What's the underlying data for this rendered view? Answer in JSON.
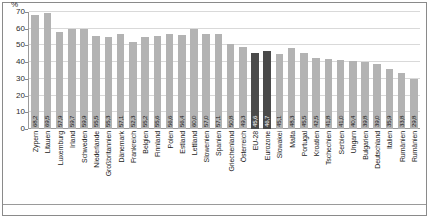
{
  "chart_data": {
    "type": "bar",
    "title": "",
    "xlabel": "",
    "ylabel": "%",
    "ylim": [
      0,
      70
    ],
    "yticks": [
      0,
      10,
      20,
      30,
      40,
      50,
      60,
      70
    ],
    "grid": true,
    "legend": "none",
    "highlight_color": "#4a4a4a",
    "bar_color": "#b3b3b3",
    "highlighted_categories": [
      "EU-28",
      "Eurozone"
    ],
    "categories": [
      "Zypern",
      "Litauen",
      "Luxemburg",
      "Irland",
      "Schweden",
      "Niederlande",
      "Großbritannien",
      "Dänemark",
      "Frankreich",
      "Belgien",
      "Finnland",
      "Polen",
      "Estland",
      "Lettland",
      "Slowenien",
      "Spanien",
      "Griechenland",
      "Österreich",
      "EU-28",
      "Eurozone",
      "Slowakei",
      "Malta",
      "Portugal",
      "Kroatien",
      "Tschechien",
      "Serbien",
      "Ungarn",
      "Bulgarien",
      "Deutschland",
      "Italien",
      "Rumänien"
    ],
    "values": [
      68.2,
      69.5,
      57.9,
      59.7,
      59.9,
      55.5,
      55.3,
      57.1,
      52.3,
      55.2,
      55.6,
      56.6,
      56.4,
      60.0,
      57.0,
      57.1,
      50.8,
      49.3,
      45.6,
      46.7,
      45.1,
      48.3,
      45.5,
      42.5,
      41.8,
      41.0,
      40.4,
      39.8,
      39.0,
      35.9,
      33.8
    ],
    "value_labels": [
      "68,2",
      "69,5",
      "57,9",
      "59,7",
      "59,9",
      "55,5",
      "55,3",
      "57,1",
      "52,3",
      "55,2",
      "55,6",
      "56,6",
      "56,4",
      "60,0",
      "57,0",
      "57,1",
      "50,8",
      "49,3",
      "45,6",
      "46,7",
      "45,1",
      "48,3",
      "45,5",
      "42,5",
      "41,8",
      "41,0",
      "40,4",
      "39,8",
      "39,0",
      "35,9",
      "33,8"
    ],
    "last_category": "Rumänien",
    "last_value": 29.8,
    "last_value_label": "29,8"
  }
}
